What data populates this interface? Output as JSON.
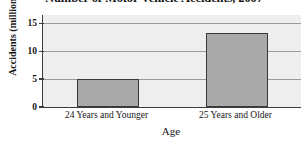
{
  "chart_data": {
    "type": "bar",
    "title": "Number of Motor Vehicle Accidents, 2007",
    "xlabel": "Age",
    "ylabel": "Accidents (millions)",
    "categories": [
      "24 Years and Younger",
      "25 Years and Older"
    ],
    "values": [
      5.0,
      13.3
    ],
    "ylim": [
      0,
      16.5
    ],
    "yticks": [
      0,
      5,
      10,
      15
    ],
    "ytick_labels": [
      "0",
      "5",
      "10",
      "15"
    ],
    "grid": "horizontal",
    "legend": "none",
    "colors": {
      "bar_fill": "#a9a9a9",
      "bar_edge": "#3a3a3a",
      "plot_background": "#eeeeee",
      "gridline": "#9a9a9a",
      "axis": "#3c3c3c",
      "text": "#161616"
    }
  }
}
